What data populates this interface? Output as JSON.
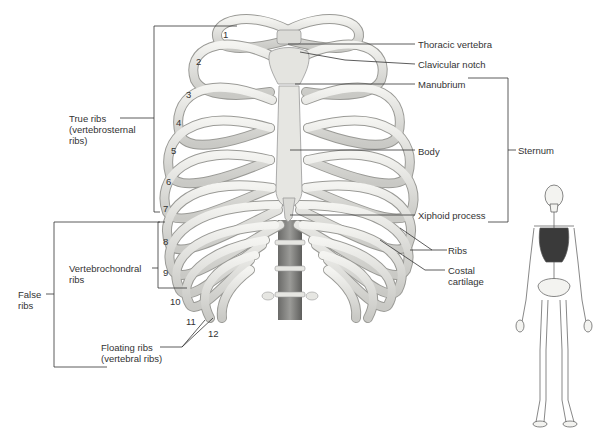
{
  "figure": {
    "rib_numbers": [
      "1",
      "2",
      "3",
      "4",
      "5",
      "6",
      "7",
      "8",
      "9",
      "10",
      "11",
      "12"
    ],
    "left_labels": {
      "true_ribs": [
        "True ribs",
        "(vertebrosternal",
        "ribs)"
      ],
      "false_ribs": [
        "False",
        "ribs"
      ],
      "vertebrochondral": [
        "Vertebrochondral",
        "ribs"
      ],
      "floating": [
        "Floating ribs",
        "(vertebral ribs)"
      ]
    },
    "right_labels": {
      "thoracic_vertebra": "Thoracic vertebra",
      "clavicular_notch": "Clavicular notch",
      "manubrium": "Manubrium",
      "body": "Body",
      "xiphoid": "Xiphoid process",
      "sternum": "Sternum",
      "ribs": "Ribs",
      "costal_cartilage": [
        "Costal",
        "cartilage"
      ]
    },
    "inset": "Full skeleton with thoracic cage highlighted",
    "colors": {
      "bone": "#e9e9e6",
      "bone_outline": "#9a9a96",
      "cartilage": "#f2f2ef",
      "highlight": "#3a3a3a",
      "leader_line": "#333333"
    }
  }
}
